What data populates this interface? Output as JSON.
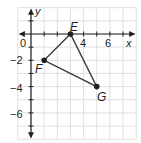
{
  "diagram": {
    "type": "coordinate-plane",
    "origin_px": [
      31,
      34
    ],
    "unit_px": 13.15,
    "x_range": [
      -1,
      8
    ],
    "y_range": [
      -8,
      2
    ],
    "axis_labels": {
      "x": "x",
      "y": "y"
    },
    "origin_label": "0",
    "x_tick_labels": [
      {
        "value": 4,
        "text": "4"
      },
      {
        "value": 6,
        "text": "6"
      }
    ],
    "y_tick_labels": [
      {
        "value": -2,
        "text": "−2"
      },
      {
        "value": -4,
        "text": "−4"
      },
      {
        "value": -6,
        "text": "−6"
      }
    ],
    "points": [
      {
        "name": "E",
        "x": 3,
        "y": 0
      },
      {
        "name": "F",
        "x": 1,
        "y": -2
      },
      {
        "name": "G",
        "x": 5,
        "y": -4
      }
    ],
    "polygon": [
      "E",
      "F",
      "G"
    ],
    "colors": {
      "grid": "#d9d9d9",
      "axis": "#231f20",
      "shape": "#3a3a3a",
      "point": "#231f20",
      "text": "#231f20"
    }
  }
}
